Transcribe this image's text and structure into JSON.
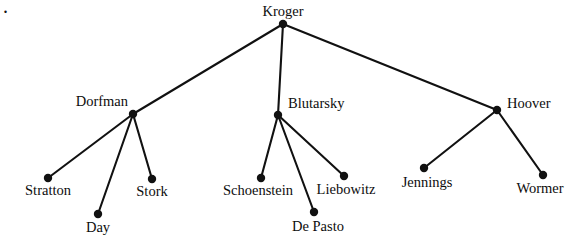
{
  "diagram": {
    "type": "tree",
    "corner_mark": ".",
    "colors": {
      "background": "#ffffff",
      "edge": "#111111",
      "node": "#111111",
      "text": "#0d0d0d"
    },
    "node_radius": 4.2,
    "edge_width": 2.1,
    "nodes": [
      {
        "id": "kroger",
        "label": "Kroger",
        "x": 283,
        "y": 24,
        "label_x": 283,
        "label_y": 4,
        "label_anchor": "center",
        "level": 0
      },
      {
        "id": "dorfman",
        "label": "Dorfman",
        "x": 133,
        "y": 114,
        "label_x": 128,
        "label_y": 94,
        "label_anchor": "right",
        "level": 1
      },
      {
        "id": "blutarsky",
        "label": "Blutarsky",
        "x": 278,
        "y": 115,
        "label_x": 288,
        "label_y": 96,
        "label_anchor": "left",
        "level": 1
      },
      {
        "id": "hoover",
        "label": "Hoover",
        "x": 497,
        "y": 110,
        "label_x": 507,
        "label_y": 96,
        "label_anchor": "left",
        "level": 1
      },
      {
        "id": "stratton",
        "label": "Stratton",
        "x": 48,
        "y": 178,
        "label_x": 48,
        "label_y": 183,
        "label_anchor": "center",
        "level": 2
      },
      {
        "id": "day",
        "label": "Day",
        "x": 98,
        "y": 214,
        "label_x": 98,
        "label_y": 220,
        "label_anchor": "center",
        "level": 2
      },
      {
        "id": "stork",
        "label": "Stork",
        "x": 152,
        "y": 179,
        "label_x": 152,
        "label_y": 184,
        "label_anchor": "center",
        "level": 2
      },
      {
        "id": "schoenstein",
        "label": "Schoenstein",
        "x": 261,
        "y": 178,
        "label_x": 258,
        "label_y": 183,
        "label_anchor": "center",
        "level": 2
      },
      {
        "id": "depasto",
        "label": "De Pasto",
        "x": 314,
        "y": 212,
        "label_x": 318,
        "label_y": 219,
        "label_anchor": "center",
        "level": 2
      },
      {
        "id": "liebowitz",
        "label": "Liebowitz",
        "x": 344,
        "y": 176,
        "label_x": 346,
        "label_y": 182,
        "label_anchor": "center",
        "level": 2
      },
      {
        "id": "jennings",
        "label": "Jennings",
        "x": 424,
        "y": 168,
        "label_x": 427,
        "label_y": 175,
        "label_anchor": "center",
        "level": 2
      },
      {
        "id": "wormer",
        "label": "Wormer",
        "x": 543,
        "y": 175,
        "label_x": 540,
        "label_y": 181,
        "label_anchor": "center",
        "level": 2
      }
    ],
    "edges": [
      {
        "from": "kroger",
        "to": "dorfman"
      },
      {
        "from": "kroger",
        "to": "blutarsky"
      },
      {
        "from": "kroger",
        "to": "hoover"
      },
      {
        "from": "dorfman",
        "to": "stratton"
      },
      {
        "from": "dorfman",
        "to": "day"
      },
      {
        "from": "dorfman",
        "to": "stork"
      },
      {
        "from": "blutarsky",
        "to": "schoenstein"
      },
      {
        "from": "blutarsky",
        "to": "depasto"
      },
      {
        "from": "blutarsky",
        "to": "liebowitz"
      },
      {
        "from": "hoover",
        "to": "jennings"
      },
      {
        "from": "hoover",
        "to": "wormer"
      }
    ]
  }
}
